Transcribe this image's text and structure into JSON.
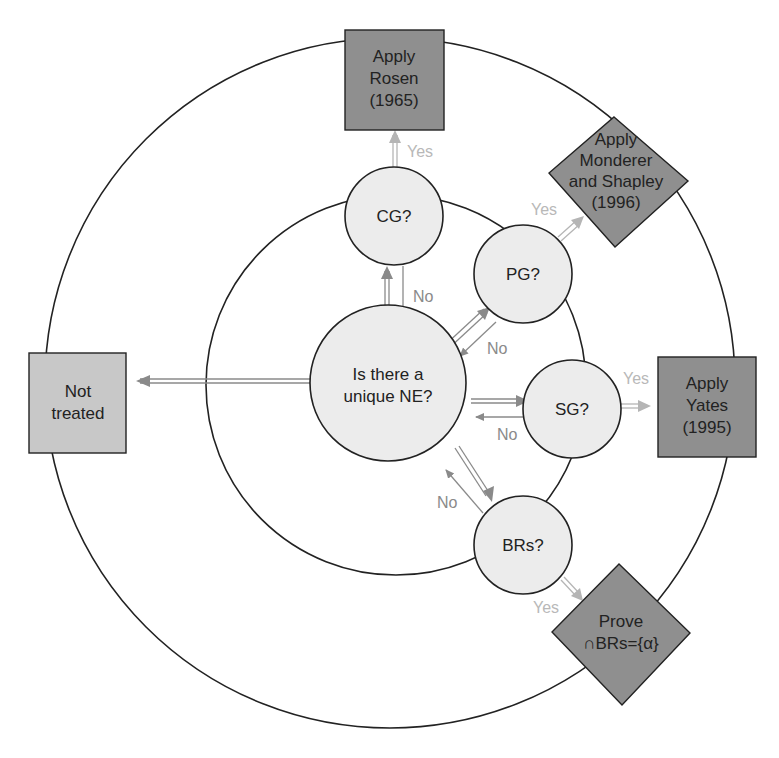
{
  "diagram": {
    "colors": {
      "ring": "#222222",
      "node_fill": "#ececec",
      "box_dark": "#8f8f8f",
      "box_light": "#c8c8c8",
      "arrow_no": "#8a8a8a",
      "arrow_yes": "#b5b5b5"
    },
    "center_node": {
      "line1": "Is there a",
      "line2": "unique NE?"
    },
    "decisions": [
      {
        "id": "cg",
        "label": "CG?"
      },
      {
        "id": "pg",
        "label": "PG?"
      },
      {
        "id": "sg",
        "label": "SG?"
      },
      {
        "id": "brs",
        "label": "BRs?"
      }
    ],
    "outcomes": {
      "rosen": {
        "line1": "Apply",
        "line2": "Rosen",
        "line3": "(1965)"
      },
      "monderer": {
        "line1": "Apply",
        "line2": "Monderer",
        "line3": "and Shapley",
        "line4": "(1996)"
      },
      "yates": {
        "line1": "Apply",
        "line2": "Yates",
        "line3": "(1995)"
      },
      "prove": {
        "line1": "Prove",
        "line2": "∩BRs={α}"
      },
      "not_treated": {
        "line1": "Not",
        "line2": "treated"
      }
    },
    "edge_labels": {
      "yes": "Yes",
      "no": "No"
    }
  }
}
